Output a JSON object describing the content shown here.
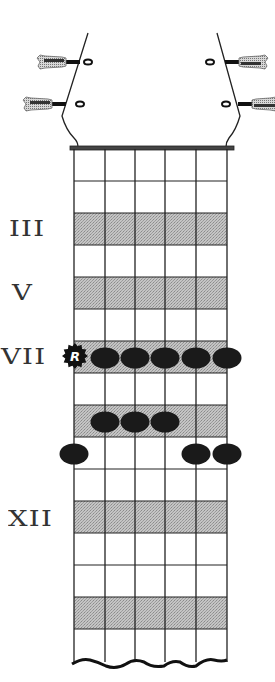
{
  "diagram": {
    "strings": 6,
    "frets_shown": 16,
    "string_x": [
      74,
      105,
      135,
      165,
      196,
      227
    ],
    "nut_y": 148,
    "fret_height": 32,
    "fret_board_bottom": 662,
    "shaded_frets": [
      3,
      5,
      7,
      9,
      12,
      15
    ],
    "shade_color": "#b8b8b8",
    "line_color": "#222222",
    "dot_color": "#1a1a1a",
    "fret_labels": [
      {
        "fret": 3,
        "label": "III",
        "x": 10
      },
      {
        "fret": 5,
        "label": "V",
        "x": 10
      },
      {
        "fret": 7,
        "label": "VII",
        "x": 2
      },
      {
        "fret": 12,
        "label": "XII",
        "x": 8
      }
    ],
    "root_marker": {
      "string": 1,
      "fret": 7,
      "label": "R"
    },
    "notes": [
      {
        "string": 2,
        "fret": 7
      },
      {
        "string": 3,
        "fret": 7
      },
      {
        "string": 4,
        "fret": 7
      },
      {
        "string": 5,
        "fret": 7
      },
      {
        "string": 6,
        "fret": 7
      },
      {
        "string": 2,
        "fret": 9
      },
      {
        "string": 3,
        "fret": 9
      },
      {
        "string": 4,
        "fret": 9
      },
      {
        "string": 1,
        "fret": 10
      },
      {
        "string": 5,
        "fret": 10
      },
      {
        "string": 6,
        "fret": 10
      }
    ],
    "tuners": [
      {
        "side": "left",
        "y": 62
      },
      {
        "side": "left",
        "y": 104
      },
      {
        "side": "right",
        "y": 62
      },
      {
        "side": "right",
        "y": 104
      }
    ]
  },
  "labels": {
    "fret3": "III",
    "fret5": "V",
    "fret7": "VII",
    "fret12": "XII",
    "root": "R"
  }
}
